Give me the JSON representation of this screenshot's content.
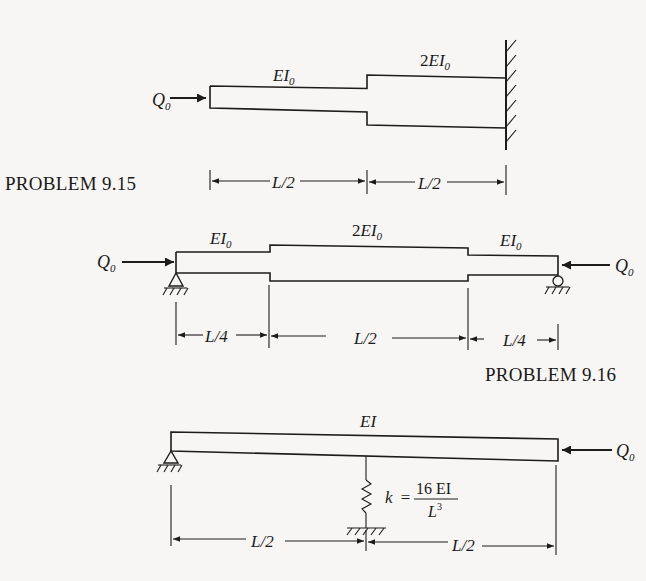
{
  "problems": [
    {
      "id": "9.15",
      "caption": "PROBLEM 9.15",
      "load": {
        "symbol": "Q",
        "subscript": "0",
        "direction": "right",
        "applied_at": "left free end"
      },
      "segments": [
        {
          "stiffness_label": "EI",
          "stiffness_sub": "0",
          "length": "L/2"
        },
        {
          "stiffness_prefix": "2",
          "stiffness_label": "EI",
          "stiffness_sub": "0",
          "length": "L/2"
        }
      ],
      "support_right": "fixed wall",
      "dimensions": [
        "L/2",
        "L/2"
      ]
    },
    {
      "id": "9.16",
      "caption": "PROBLEM 9.16",
      "load_left": {
        "symbol": "Q",
        "subscript": "0",
        "direction": "right"
      },
      "load_right": {
        "symbol": "Q",
        "subscript": "0",
        "direction": "left"
      },
      "segments": [
        {
          "stiffness_label": "EI",
          "stiffness_sub": "0",
          "length": "L/4"
        },
        {
          "stiffness_prefix": "2",
          "stiffness_label": "EI",
          "stiffness_sub": "0",
          "length": "L/2"
        },
        {
          "stiffness_label": "EI",
          "stiffness_sub": "0",
          "length": "L/4"
        }
      ],
      "support_left": "pin",
      "support_right": "roller",
      "dimensions": [
        "L/4",
        "L/2",
        "L/4"
      ]
    },
    {
      "id": "spring-beam",
      "caption": "",
      "stiffness_label": "EI",
      "load": {
        "symbol": "Q",
        "subscript": "0",
        "direction": "left",
        "applied_at": "right end"
      },
      "support_left": "pin",
      "spring": {
        "label": "k =",
        "numerator": "16 EI",
        "denominator_base": "L",
        "denominator_exp": "3",
        "position": "midspan"
      },
      "dimensions": [
        "L/2",
        "L/2"
      ]
    }
  ]
}
